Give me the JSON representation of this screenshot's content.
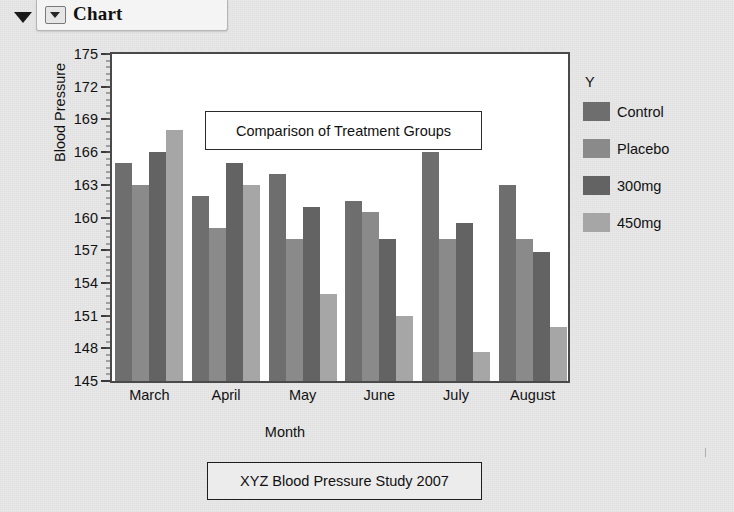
{
  "window": {
    "title": "Chart",
    "collapse_icon": "triangle-down-icon",
    "tab_icon": "chart-dropdown-icon"
  },
  "legend": {
    "title": "Y",
    "items": [
      {
        "label": "Control",
        "color": "#6e6e6e"
      },
      {
        "label": "Placebo",
        "color": "#8a8a8a"
      },
      {
        "label": "300mg",
        "color": "#636363"
      },
      {
        "label": "450mg",
        "color": "#a6a6a6"
      }
    ]
  },
  "footer": {
    "text": "XYZ Blood Pressure Study 2007"
  },
  "chart_data": {
    "type": "bar",
    "title": "Comparison of Treatment Groups",
    "xlabel": "Month",
    "ylabel": "Blood Pressure",
    "categories": [
      "March",
      "April",
      "May",
      "June",
      "July",
      "August"
    ],
    "ylim": [
      145,
      175
    ],
    "yticks": [
      145,
      148,
      151,
      154,
      157,
      160,
      163,
      166,
      169,
      172,
      175
    ],
    "ytick_step": 3,
    "minor_ticks_per_major": 5,
    "grid": false,
    "legend_position": "right",
    "series": [
      {
        "name": "Control",
        "color": "#6e6e6e",
        "values": [
          165.0,
          162.0,
          164.0,
          161.5,
          166.0,
          163.0
        ]
      },
      {
        "name": "Placebo",
        "color": "#8a8a8a",
        "values": [
          163.0,
          159.0,
          158.0,
          160.5,
          158.0,
          158.0
        ]
      },
      {
        "name": "300mg",
        "color": "#636363",
        "values": [
          166.0,
          165.0,
          161.0,
          158.0,
          159.5,
          156.8
        ]
      },
      {
        "name": "450mg",
        "color": "#a6a6a6",
        "values": [
          168.0,
          163.0,
          153.0,
          151.0,
          147.7,
          150.0
        ]
      }
    ]
  }
}
